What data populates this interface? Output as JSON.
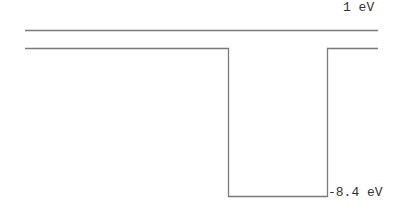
{
  "diagram": {
    "type": "energy-band-potential-well",
    "top_level_label": "1 eV",
    "well_bottom_label": "-8.4 eV",
    "colors": {
      "line": "#7a7a7a",
      "text": "#333333",
      "background": "#ffffff"
    }
  }
}
